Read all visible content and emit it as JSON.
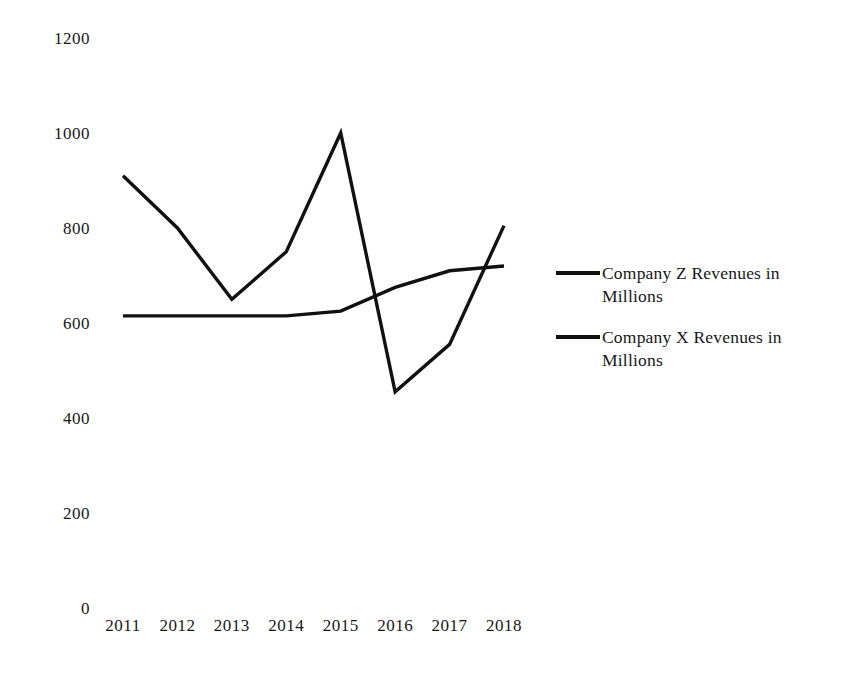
{
  "chart_data": {
    "type": "line",
    "title": "",
    "subtitle": "",
    "xlabel": "",
    "ylabel": "",
    "categories": [
      "2011",
      "2012",
      "2013",
      "2014",
      "2015",
      "2016",
      "2017",
      "2018"
    ],
    "x": [
      2011,
      2012,
      2013,
      2014,
      2015,
      2016,
      2017,
      2018
    ],
    "series": [
      {
        "name": "Company Z Revenues in Millions",
        "color": "#111111",
        "values": [
          910,
          800,
          650,
          750,
          1000,
          455,
          555,
          805
        ]
      },
      {
        "name": "Company X Revenues in Millions",
        "color": "#111111",
        "values": [
          615,
          615,
          615,
          615,
          625,
          675,
          710,
          720
        ]
      }
    ],
    "ylim": [
      0,
      1200
    ],
    "yticks": [
      0,
      200,
      400,
      600,
      800,
      1000,
      1200
    ],
    "ytick_labels": [
      "0",
      "200",
      "400",
      "600",
      "800",
      "1000",
      "1200"
    ],
    "xtick_labels": [
      "2011",
      "2012",
      "2013",
      "2014",
      "2015",
      "2016",
      "2017",
      "2018"
    ],
    "grid": false,
    "axis_lines": false,
    "legend_position": "right",
    "legend": [
      "Company Z Revenues in Millions",
      "Company X Revenues in Millions"
    ]
  },
  "legend": {
    "items": [
      {
        "label": "Company Z Revenues in Millions"
      },
      {
        "label": "Company X Revenues in Millions"
      }
    ]
  }
}
